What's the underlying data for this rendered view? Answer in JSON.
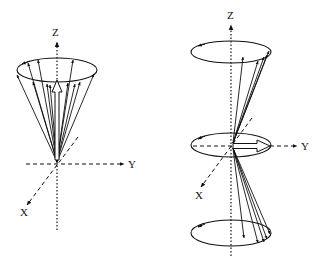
{
  "diagram": {
    "left": {
      "axis_labels": {
        "z": "Z",
        "y": "Y",
        "x": "X"
      },
      "description": "Cone of precessing vectors about Z with net magnetization arrow along Z"
    },
    "right": {
      "axis_labels": {
        "z": "Z",
        "y": "Y",
        "x": "X"
      },
      "description": "Two cones (up and down) with net magnetization arrow along Y in the XY plane"
    },
    "colors": {
      "stroke": "#111111",
      "background": "#ffffff"
    }
  }
}
